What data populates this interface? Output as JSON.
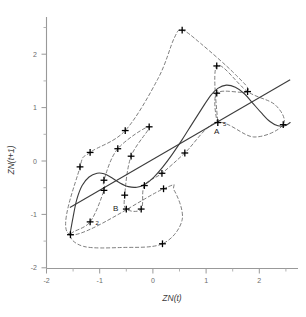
{
  "chart_data": {
    "type": "scatter",
    "title": "",
    "subtitle": "",
    "xlabel": "ZN(t)",
    "ylabel": "ZN(t+1)",
    "xlim": [
      -2.0,
      2.6
    ],
    "ylim": [
      -2.0,
      2.6
    ],
    "xticks": [
      -2,
      -1,
      0,
      1,
      2
    ],
    "xtick_labels": [
      "-2",
      "-1",
      "0",
      "1",
      "2"
    ],
    "yticks": [
      -2,
      -1,
      0,
      1,
      2
    ],
    "ytick_labels": [
      "-2",
      "-1",
      "0",
      "1",
      "2"
    ],
    "xminor_ticks": [
      -1.5,
      -0.5,
      0.5,
      1.5,
      2.5
    ],
    "yminor_ticks": [
      -1.5,
      -0.5,
      0.5,
      1.5,
      2.5
    ],
    "grid": false,
    "legend": "none",
    "series": [
      {
        "name": "observations",
        "marker": "plus",
        "points": [
          [
            0.55,
            2.45
          ],
          [
            1.2,
            1.78
          ],
          [
            1.78,
            1.3
          ],
          [
            1.2,
            1.27
          ],
          [
            2.45,
            0.68
          ],
          [
            1.22,
            0.72
          ],
          [
            -0.52,
            0.57
          ],
          [
            -0.07,
            0.64
          ],
          [
            0.6,
            0.15
          ],
          [
            -0.66,
            0.23
          ],
          [
            -0.41,
            0.09
          ],
          [
            -1.18,
            0.16
          ],
          [
            -1.37,
            -0.11
          ],
          [
            0.17,
            -0.23
          ],
          [
            -0.92,
            -0.36
          ],
          [
            -0.16,
            -0.46
          ],
          [
            -0.92,
            -0.55
          ],
          [
            0.2,
            -0.52
          ],
          [
            -0.53,
            -0.64
          ],
          [
            -0.5,
            -0.9
          ],
          [
            -0.22,
            -0.9
          ],
          [
            -1.18,
            -1.14
          ],
          [
            -1.55,
            -1.38
          ],
          [
            0.18,
            -1.55
          ]
        ]
      }
    ],
    "annotations": [
      {
        "text": "A",
        "x": 1.15,
        "y": 0.5
      },
      {
        "text": "B",
        "x": -0.75,
        "y": -0.93
      },
      {
        "text": "5",
        "x": 1.32,
        "y": 0.66
      },
      {
        "text": "2",
        "x": -1.08,
        "y": -1.2
      }
    ],
    "trend_line": {
      "style": "solid",
      "from": [
        -1.56,
        -0.87
      ],
      "to": [
        2.58,
        1.52
      ]
    },
    "fitted_curve": {
      "style": "solid",
      "description": "smooth nonlinear fit",
      "points": [
        [
          -1.56,
          -1.38
        ],
        [
          -1.5,
          -1.05
        ],
        [
          -1.43,
          -0.72
        ],
        [
          -1.33,
          -0.46
        ],
        [
          -1.2,
          -0.3
        ],
        [
          -1.05,
          -0.23
        ],
        [
          -0.92,
          -0.24
        ],
        [
          -0.78,
          -0.31
        ],
        [
          -0.62,
          -0.41
        ],
        [
          -0.46,
          -0.48
        ],
        [
          -0.3,
          -0.49
        ],
        [
          -0.14,
          -0.43
        ],
        [
          0.02,
          -0.3
        ],
        [
          0.18,
          -0.12
        ],
        [
          0.36,
          0.12
        ],
        [
          0.55,
          0.4
        ],
        [
          0.74,
          0.7
        ],
        [
          0.92,
          0.98
        ],
        [
          1.08,
          1.22
        ],
        [
          1.22,
          1.36
        ],
        [
          1.38,
          1.42
        ],
        [
          1.55,
          1.38
        ],
        [
          1.72,
          1.26
        ],
        [
          1.88,
          1.08
        ],
        [
          2.04,
          0.9
        ],
        [
          2.2,
          0.74
        ],
        [
          2.35,
          0.66
        ],
        [
          2.48,
          0.66
        ],
        [
          2.58,
          0.72
        ]
      ]
    },
    "trajectory": {
      "style": "dashed",
      "description": "dashed trajectory connecting successive observations",
      "path": [
        [
          -1.55,
          -1.38
        ],
        [
          -1.37,
          -0.11
        ],
        [
          -1.18,
          0.16
        ],
        [
          -0.52,
          0.57
        ],
        [
          0.1,
          1.55
        ],
        [
          0.4,
          2.3
        ],
        [
          0.55,
          2.45
        ],
        [
          0.9,
          2.2
        ],
        [
          1.55,
          1.62
        ],
        [
          1.78,
          1.3
        ],
        [
          1.2,
          1.27
        ],
        [
          1.22,
          0.72
        ],
        [
          1.2,
          1.78
        ],
        [
          1.78,
          1.3
        ],
        [
          2.3,
          1.05
        ],
        [
          2.45,
          0.68
        ],
        [
          1.9,
          0.45
        ],
        [
          1.2,
          0.72
        ],
        [
          0.6,
          0.15
        ],
        [
          0.17,
          -0.23
        ],
        [
          -0.16,
          -0.46
        ],
        [
          -0.22,
          -0.9
        ],
        [
          -0.5,
          -0.9
        ],
        [
          -0.53,
          -0.64
        ],
        [
          -0.41,
          0.09
        ],
        [
          -0.07,
          0.64
        ],
        [
          -0.66,
          0.23
        ],
        [
          -0.92,
          -0.36
        ],
        [
          -0.92,
          -0.55
        ],
        [
          -1.18,
          -1.14
        ],
        [
          -1.55,
          -1.38
        ],
        [
          -1.3,
          -1.6
        ],
        [
          -0.6,
          -1.62
        ],
        [
          0.18,
          -1.55
        ],
        [
          0.55,
          -1.1
        ],
        [
          0.4,
          -0.55
        ],
        [
          0.2,
          -0.52
        ]
      ]
    }
  }
}
